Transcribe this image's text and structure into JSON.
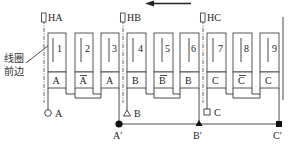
{
  "diagram": {
    "title": "",
    "direction_arrow": {
      "direction": "left"
    },
    "pole_markers": [
      {
        "label": "HA",
        "x": 44
      },
      {
        "label": "HB",
        "x": 123
      },
      {
        "label": "HC",
        "x": 203
      }
    ],
    "coil_front_label_line1": "线圈",
    "coil_front_label_line2": "前边",
    "coils": [
      {
        "number": "1",
        "phase": "A",
        "overbar": false
      },
      {
        "number": "2",
        "phase": "A",
        "overbar": true
      },
      {
        "number": "3",
        "phase": "A",
        "overbar": false
      },
      {
        "number": "4",
        "phase": "B",
        "overbar": false
      },
      {
        "number": "5",
        "phase": "B",
        "overbar": true
      },
      {
        "number": "6",
        "phase": "B",
        "overbar": false
      },
      {
        "number": "7",
        "phase": "C",
        "overbar": false
      },
      {
        "number": "8",
        "phase": "C",
        "overbar": true
      },
      {
        "number": "9",
        "phase": "C",
        "overbar": false
      }
    ],
    "start_terminals": [
      {
        "label": "A",
        "symbol": "open-circle"
      },
      {
        "label": "B",
        "symbol": "open-triangle"
      },
      {
        "label": "C",
        "symbol": "open-square"
      }
    ],
    "end_terminals": [
      {
        "label": "A′",
        "symbol": "filled-circle"
      },
      {
        "label": "B′",
        "symbol": "filled-triangle"
      },
      {
        "label": "C′",
        "symbol": "filled-square"
      }
    ]
  }
}
